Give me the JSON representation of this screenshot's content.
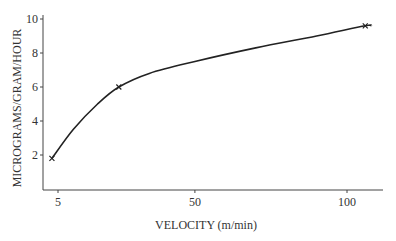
{
  "chart_data": {
    "type": "line",
    "title": "",
    "xlabel": "VELOCITY (m/min)",
    "ylabel": "MICROGRAMS/GRAM/HOUR",
    "x_ticks": [
      "5",
      "50",
      "100"
    ],
    "y_ticks": [
      "2",
      "4",
      "6",
      "8",
      "10"
    ],
    "xlim": [
      0,
      110
    ],
    "ylim": [
      0,
      10
    ],
    "grid": false,
    "legend": null,
    "series": [
      {
        "name": "uptake",
        "marked_points": [
          {
            "x": 3,
            "y": 1.8
          },
          {
            "x": 25,
            "y": 6.0
          },
          {
            "x": 106,
            "y": 9.6
          }
        ],
        "curve": [
          {
            "x": 3,
            "y": 1.8
          },
          {
            "x": 10,
            "y": 3.5
          },
          {
            "x": 18,
            "y": 5.0
          },
          {
            "x": 25,
            "y": 6.0
          },
          {
            "x": 35,
            "y": 6.8
          },
          {
            "x": 50,
            "y": 7.5
          },
          {
            "x": 70,
            "y": 8.3
          },
          {
            "x": 90,
            "y": 9.0
          },
          {
            "x": 106,
            "y": 9.6
          },
          {
            "x": 108,
            "y": 9.6
          }
        ]
      }
    ]
  }
}
